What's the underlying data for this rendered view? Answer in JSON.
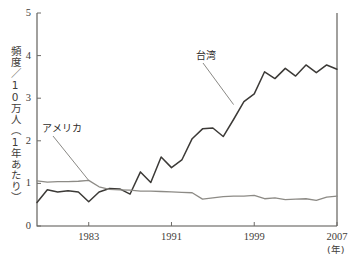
{
  "chart_data": {
    "type": "line",
    "title": "",
    "xlabel": "(年)",
    "ylabel": "頻度／10万人（1年あたり）",
    "xlim": [
      1978,
      2007
    ],
    "ylim": [
      0,
      5
    ],
    "grid": false,
    "legend_position": "inline-annotations",
    "x_tick_labels": [
      "1983",
      "1991",
      "1999",
      "2007"
    ],
    "x_ticks": [
      1983,
      1991,
      1999,
      2007
    ],
    "y_tick_labels": [
      "0",
      "1",
      "2",
      "3",
      "4",
      "5"
    ],
    "y_ticks": [
      0,
      1,
      2,
      3,
      4,
      5
    ],
    "x": [
      1978,
      1979,
      1980,
      1981,
      1982,
      1983,
      1984,
      1985,
      1986,
      1987,
      1988,
      1989,
      1990,
      1991,
      1992,
      1993,
      1994,
      1995,
      1996,
      1997,
      1998,
      1999,
      2000,
      2001,
      2002,
      2003,
      2004,
      2005,
      2006,
      2007
    ],
    "series": [
      {
        "name": "台湾",
        "color": "#3c3a37",
        "values": [
          0.55,
          0.85,
          0.8,
          0.83,
          0.8,
          0.57,
          0.8,
          0.88,
          0.87,
          0.75,
          1.27,
          1.02,
          1.62,
          1.37,
          1.55,
          2.05,
          2.28,
          2.3,
          2.1,
          2.5,
          2.92,
          3.1,
          3.62,
          3.46,
          3.7,
          3.52,
          3.78,
          3.6,
          3.78,
          3.68
        ]
      },
      {
        "name": "アメリカ",
        "color": "#8d8b86",
        "values": [
          1.06,
          1.03,
          1.04,
          1.04,
          1.05,
          1.07,
          0.92,
          0.86,
          0.85,
          0.84,
          0.82,
          0.82,
          0.81,
          0.8,
          0.79,
          0.78,
          0.63,
          0.66,
          0.69,
          0.7,
          0.7,
          0.72,
          0.64,
          0.66,
          0.62,
          0.63,
          0.64,
          0.6,
          0.68,
          0.7
        ]
      }
    ],
    "annotations": [
      {
        "text": "台湾",
        "target_x": 1997,
        "target_y": 2.85
      },
      {
        "text": "アメリカ",
        "target_x": 1983,
        "target_y": 1.07
      }
    ]
  },
  "axis": {
    "y_unit_text": "頻度／10万人（1年あたり）",
    "x_unit_text": "(年)"
  },
  "labels": {
    "taiwan": "台湾",
    "america": "アメリカ"
  },
  "ticks": {
    "y": [
      "5",
      "4",
      "3",
      "2",
      "1",
      "0"
    ],
    "x": [
      "1983",
      "1991",
      "1999",
      "2007"
    ]
  },
  "colors": {
    "taiwan_line": "#3c3a37",
    "america_line": "#8d8b86",
    "axis": "#55534f",
    "background": "#ffffff"
  }
}
